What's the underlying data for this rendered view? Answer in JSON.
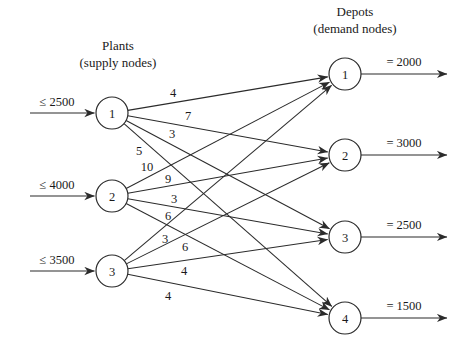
{
  "figure": {
    "type": "network-flow-diagram",
    "background_color": "#ffffff",
    "line_color": "#2b2b2b",
    "text_color": "#1a1a1a"
  },
  "headers": {
    "left": {
      "line1": "Plants",
      "line2": "(supply nodes)"
    },
    "right": {
      "line1": "Depots",
      "line2": "(demand nodes)"
    }
  },
  "supply_nodes": [
    {
      "id": "plant-1",
      "label": "1",
      "capacity_label": "≤ 2500",
      "cx": 112,
      "cy": 113
    },
    {
      "id": "plant-2",
      "label": "2",
      "capacity_label": "≤ 4000",
      "cx": 112,
      "cy": 196
    },
    {
      "id": "plant-3",
      "label": "3",
      "capacity_label": "≤ 3500",
      "cx": 112,
      "cy": 271
    }
  ],
  "demand_nodes": [
    {
      "id": "depot-1",
      "label": "1",
      "demand_label": "= 2000",
      "cx": 345,
      "cy": 74
    },
    {
      "id": "depot-2",
      "label": "2",
      "demand_label": "= 3000",
      "cx": 345,
      "cy": 155
    },
    {
      "id": "depot-3",
      "label": "3",
      "demand_label": "= 2500",
      "cx": 345,
      "cy": 237
    },
    {
      "id": "depot-4",
      "label": "4",
      "demand_label": "= 1500",
      "cx": 345,
      "cy": 318
    }
  ],
  "edges": [
    {
      "id": "e-1-1",
      "from": "plant-1",
      "to": "depot-1",
      "cost": "4",
      "label_x": 173,
      "label_y": 93
    },
    {
      "id": "e-1-2",
      "from": "plant-1",
      "to": "depot-2",
      "cost": "7",
      "label_x": 188,
      "label_y": 116
    },
    {
      "id": "e-1-3",
      "from": "plant-1",
      "to": "depot-3",
      "cost": "3",
      "label_x": 172,
      "label_y": 134
    },
    {
      "id": "e-1-4",
      "from": "plant-1",
      "to": "depot-4",
      "cost": "5",
      "label_x": 139,
      "label_y": 151
    },
    {
      "id": "e-2-1",
      "from": "plant-2",
      "to": "depot-1",
      "cost": "10",
      "label_x": 147,
      "label_y": 167
    },
    {
      "id": "e-2-2",
      "from": "plant-2",
      "to": "depot-2",
      "cost": "9",
      "label_x": 168,
      "label_y": 179
    },
    {
      "id": "e-2-3",
      "from": "plant-2",
      "to": "depot-3",
      "cost": "3",
      "label_x": 174,
      "label_y": 199
    },
    {
      "id": "e-2-4",
      "from": "plant-2",
      "to": "depot-4",
      "cost": "6",
      "label_x": 168,
      "label_y": 216
    },
    {
      "id": "e-3-1",
      "from": "plant-3",
      "to": "depot-1",
      "cost": "3",
      "label_x": 165,
      "label_y": 239
    },
    {
      "id": "e-3-2",
      "from": "plant-3",
      "to": "depot-2",
      "cost": "6",
      "label_x": 185,
      "label_y": 247
    },
    {
      "id": "e-3-3",
      "from": "plant-3",
      "to": "depot-3",
      "cost": "4",
      "label_x": 184,
      "label_y": 271
    },
    {
      "id": "e-3-4",
      "from": "plant-3",
      "to": "depot-4",
      "cost": "4",
      "label_x": 168,
      "label_y": 296
    }
  ],
  "geometry": {
    "node_radius": 16,
    "supply_arrow_start_x": 30,
    "supply_arrow_end_x": 96,
    "supply_label_x": 57,
    "supply_label_dy": -11,
    "demand_arrow_start_x": 361,
    "demand_arrow_end_x": 447,
    "demand_label_x": 404,
    "demand_label_dy": -12,
    "header_left_x": 118,
    "header_left_y1": 45,
    "header_left_y2": 62,
    "header_right_x": 355,
    "header_right_y1": 11,
    "header_right_y2": 28
  }
}
